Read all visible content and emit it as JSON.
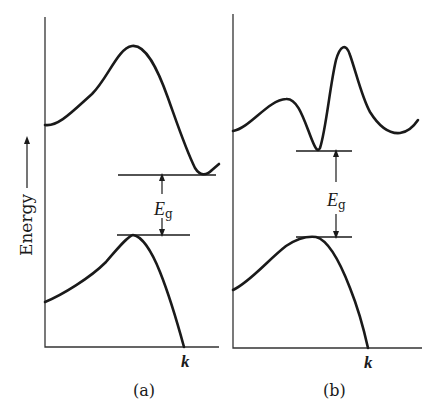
{
  "figure": {
    "y_axis_label": "Energy",
    "panels": [
      {
        "id": "a",
        "caption": "(a)",
        "x_axis_label": "k",
        "gap_label_main": "E",
        "gap_label_sub": "g",
        "description": "Indirect band gap: conduction band minimum and valence band maximum at different k"
      },
      {
        "id": "b",
        "caption": "(b)",
        "x_axis_label": "k",
        "gap_label_main": "E",
        "gap_label_sub": "g",
        "description": "Direct band gap: conduction band minimum and valence band maximum at the same k"
      }
    ]
  },
  "colors": {
    "line": "#1a1a1a",
    "axis": "#333333",
    "background": "#ffffff"
  }
}
